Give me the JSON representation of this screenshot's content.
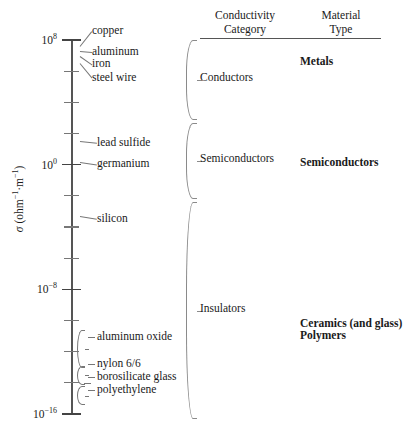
{
  "chart_data": {
    "type": "scale-diagram",
    "ylabel": "σ (ohm⁻¹·m⁻¹)",
    "axis": {
      "scale": "log10",
      "unit": "ohm^-1 m^-1",
      "top_exponent": 8,
      "bottom_exponent": -16,
      "tick_step_decades": 2,
      "labeled_ticks": [
        {
          "exp": 8,
          "text": "10",
          "sup": "8"
        },
        {
          "exp": 0,
          "text": "10",
          "sup": "0"
        },
        {
          "exp": -8,
          "text": "10",
          "sup": "-8"
        },
        {
          "exp": -16,
          "text": "10",
          "sup": "-16"
        }
      ]
    },
    "materials": [
      {
        "name": "copper",
        "exp": 7.6
      },
      {
        "name": "aluminum",
        "exp": 7.3
      },
      {
        "name": "iron",
        "exp": 7.0
      },
      {
        "name": "steel wire",
        "exp": 6.5
      },
      {
        "name": "lead sulfide",
        "exp": 1.5
      },
      {
        "name": "germanium",
        "exp": 0.2
      },
      {
        "name": "silicon",
        "exp": -3.3
      },
      {
        "name": "aluminum oxide",
        "exp": -11.7,
        "range": [
          -10.6,
          -12.9
        ]
      },
      {
        "name": "nylon 6/6",
        "exp": -13.4,
        "range": [
          -12.9,
          -14.0
        ]
      },
      {
        "name": "borosilicate glass",
        "exp": -14.0
      },
      {
        "name": "polyethylene",
        "exp": -14.7,
        "range": [
          -14.2,
          -15.3
        ]
      }
    ],
    "categories": [
      {
        "label": "Conductors",
        "top_exp": 8.0,
        "bottom_exp": 3.0
      },
      {
        "label": "Semiconductors",
        "top_exp": 2.7,
        "bottom_exp": -2.1
      },
      {
        "label": "Insulators",
        "top_exp": -2.4,
        "bottom_exp": -16.2
      }
    ],
    "material_types": [
      {
        "label": "Metals",
        "align_exp": 6.6
      },
      {
        "label": "Semiconductors",
        "align_exp": 0.1
      },
      {
        "label": "Ceramics (and glass)",
        "align_exp": -10.2
      },
      {
        "label": "Polymers",
        "align_exp": -11.0
      }
    ],
    "headers": {
      "col1_line1": "Conductivity",
      "col1_line2": "Category",
      "col2_line1": "Material",
      "col2_line2": "Type"
    },
    "colors": {
      "axis": "#555555",
      "leader": "#777777",
      "brace": "#8a8a8a",
      "text": "#1a1a1a"
    }
  }
}
